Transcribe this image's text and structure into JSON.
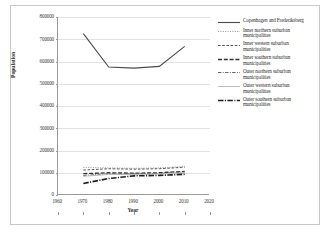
{
  "chart_data": {
    "type": "line",
    "title": "",
    "xlabel": "Year",
    "ylabel": "Population",
    "xlim": [
      1960,
      2020
    ],
    "ylim": [
      0,
      800000
    ],
    "xticks": [
      "1960",
      "1970",
      "1980",
      "1990",
      "2000",
      "2010",
      "2020"
    ],
    "xtick_values": [
      1960,
      1970,
      1980,
      1990,
      2000,
      2010,
      2020
    ],
    "yticks": [
      "0",
      "100000",
      "200000",
      "300000",
      "400000",
      "500000",
      "600000",
      "700000",
      "800000"
    ],
    "ytick_values": [
      0,
      100000,
      200000,
      300000,
      400000,
      500000,
      600000,
      700000,
      800000
    ],
    "grid": true,
    "grid_axis": "y",
    "legend_position": "right",
    "x": [
      1970,
      1980,
      1990,
      2000,
      2010
    ],
    "series": [
      {
        "name": "Copenhagen and Frederiksberg",
        "style": "solid",
        "color": "#4a4a4a",
        "width": 1.1,
        "values": [
          725000,
          575000,
          570000,
          578000,
          668000
        ]
      },
      {
        "name": "Inner northern suburban municipalities",
        "style": "dotted",
        "color": "#8c8c8c",
        "width": 0.9,
        "values": [
          124000,
          122000,
          120000,
          122000,
          128000
        ]
      },
      {
        "name": "Inner western suburban municipalities",
        "style": "dashed",
        "color": "#555555",
        "width": 1.0,
        "values": [
          112000,
          118000,
          116000,
          118000,
          125000
        ]
      },
      {
        "name": "Inner southern suburban municipalities",
        "style": "long-dashed",
        "color": "#333333",
        "width": 1.3,
        "values": [
          96000,
          100000,
          98000,
          100000,
          106000
        ]
      },
      {
        "name": "Outer northern suburban municipalities",
        "style": "dash-dot",
        "color": "#666666",
        "width": 1.0,
        "values": [
          88000,
          96000,
          95000,
          97000,
          103000
        ]
      },
      {
        "name": "Outer western suburban municipalities",
        "style": "faint-solid",
        "color": "#b4b4b4",
        "width": 0.9,
        "values": [
          84000,
          92000,
          92000,
          94000,
          100000
        ]
      },
      {
        "name": "Outer southern suburban municipalities",
        "style": "thick-dash-dot",
        "color": "#1f1f1f",
        "width": 1.6,
        "values": [
          52000,
          74000,
          86000,
          88000,
          93000
        ]
      }
    ]
  },
  "legend": {
    "items": [
      {
        "label": "Copenhagen and Frederiksberg"
      },
      {
        "label": "Inner northern suburban municipalities"
      },
      {
        "label": "Inner western suburban municipalities"
      },
      {
        "label": "Inner southern suburban municipalities"
      },
      {
        "label": "Outer northern suburban municipalities"
      },
      {
        "label": "Outer western suburban municipalities"
      },
      {
        "label": "Outer southern suburban municipalities"
      }
    ]
  },
  "axes": {
    "x_title": "Year",
    "y_title": "Population"
  }
}
